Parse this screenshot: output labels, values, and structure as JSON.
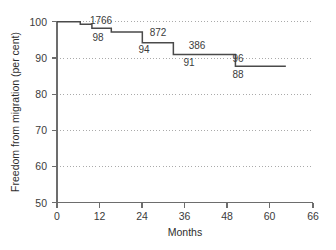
{
  "chart_data": {
    "type": "line",
    "subtype": "kaplan-meier-step",
    "title": "",
    "xlabel": "Months",
    "ylabel": "Freedom from migration (per cent)",
    "xlim": [
      0,
      66
    ],
    "ylim": [
      50,
      100
    ],
    "xticks": [
      0,
      12,
      24,
      36,
      48,
      60,
      66
    ],
    "xtick_labels": [
      "0",
      "12",
      "24",
      "36",
      "48",
      "60",
      "66"
    ],
    "yticks": [
      50,
      60,
      70,
      80,
      90,
      100
    ],
    "ytick_labels": [
      "50",
      "60",
      "70",
      "80",
      "90",
      "100"
    ],
    "grid": "horizontal-dotted",
    "legend": "none",
    "series": [
      {
        "name": "Freedom from migration",
        "x": [
          0,
          6,
          9,
          14,
          22,
          30,
          46,
          59
        ],
        "y": [
          100,
          99.3,
          98.2,
          97.2,
          94.2,
          91.0,
          87.7,
          87.7
        ]
      }
    ],
    "annotations": [
      {
        "text": "1766",
        "x": 12.5,
        "y": 100.2,
        "role": "at-risk-count"
      },
      {
        "text": "98",
        "x": 11.5,
        "y": 96.8,
        "role": "survival-percent"
      },
      {
        "text": "872",
        "x": 28.5,
        "y": 97.3,
        "role": "at-risk-count"
      },
      {
        "text": "94",
        "x": 24.5,
        "y": 92.6,
        "role": "survival-percent"
      },
      {
        "text": "386",
        "x": 39.5,
        "y": 93.5,
        "role": "at-risk-count"
      },
      {
        "text": "91",
        "x": 37.0,
        "y": 89.3,
        "role": "survival-percent"
      },
      {
        "text": "96",
        "x": 51.0,
        "y": 89.8,
        "role": "at-risk-count"
      },
      {
        "text": "88",
        "x": 51.0,
        "y": 85.6,
        "role": "survival-percent"
      }
    ],
    "colors": {
      "curve": "#4a4a4a",
      "axis": "#6d6d6d",
      "grid": "#aaaaaa",
      "text": "#3b3b3b",
      "background": "#ffffff"
    }
  }
}
